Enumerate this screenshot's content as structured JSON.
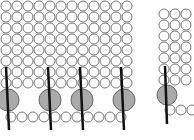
{
  "diagram": {
    "colors": {
      "background": "#ffffff",
      "small_circle_stroke": "#777777",
      "large_circle_fill": "#aaaaaa",
      "large_circle_stroke": "#666666",
      "rod": "#111111"
    },
    "left_block": {
      "origin_x": 6,
      "origin_y": 6,
      "pitch": 11,
      "cols": 12,
      "rows": 8,
      "small_radius": 5,
      "bottom_row": {
        "y": 117,
        "start_x": 11,
        "count": 11
      },
      "inclusions": [
        {
          "cx": 8,
          "cy": 100,
          "r": 11,
          "rod": [
            6,
            67,
            9,
            130
          ]
        },
        {
          "cx": 50,
          "cy": 100,
          "r": 11,
          "rod": [
            48,
            67,
            51,
            130
          ]
        },
        {
          "cx": 82,
          "cy": 100,
          "r": 11,
          "rod": [
            80,
            67,
            83,
            130
          ]
        },
        {
          "cx": 124,
          "cy": 100,
          "r": 11,
          "rod": [
            121,
            67,
            124,
            130
          ]
        }
      ]
    },
    "right_block": {
      "origin_x": 164,
      "origin_y": 14,
      "pitch": 11,
      "cols": 3,
      "rows": 7,
      "small_radius": 5,
      "bottom_row": {
        "y": 110,
        "start_x": 170,
        "count": 3
      },
      "inclusions": [
        {
          "cx": 167,
          "cy": 95,
          "r": 10,
          "rod": [
            165,
            66,
            167,
            124
          ]
        }
      ]
    }
  }
}
